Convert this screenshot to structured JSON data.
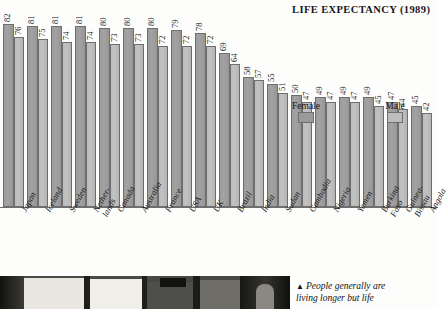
{
  "title": "LIFE EXPECTANCY (1989)",
  "legend": {
    "female_label": "Female",
    "male_label": "Male",
    "female_color": "#9a9a9a",
    "male_color": "#bdbdbd"
  },
  "caption": {
    "marker": "▲",
    "line1": "People generally are",
    "line2": "living longer but life"
  },
  "chart_data": {
    "type": "bar",
    "title": "LIFE EXPECTANCY (1989)",
    "xlabel": "",
    "ylabel": "",
    "ylim": [
      0,
      85
    ],
    "grid": false,
    "legend_position": "inside-upper-right",
    "categories": [
      "Japan",
      "Iceland",
      "Sweden",
      "Nether-lands",
      "Canada",
      "Australia",
      "France",
      "USA",
      "UK",
      "Brazil",
      "India",
      "Sudan",
      "Cambodia",
      "Nigeria",
      "Yemen",
      "Burkina Faso",
      "Guinea-Bissau",
      "Angola"
    ],
    "series": [
      {
        "name": "Female",
        "color": "#9a9a9a",
        "values": [
          82,
          81,
          81,
          81,
          80,
          80,
          80,
          79,
          78,
          69,
          58,
          55,
          50,
          49,
          49,
          49,
          47,
          45
        ]
      },
      {
        "name": "Male",
        "color": "#bdbdbd",
        "values": [
          76,
          75,
          74,
          74,
          73,
          73,
          72,
          72,
          72,
          64,
          57,
          51,
          47,
          47,
          47,
          45,
          44,
          42
        ]
      }
    ]
  },
  "countries": [
    {
      "name": "Japan",
      "l1": "Japan",
      "l2": "",
      "female": 82,
      "male": 76
    },
    {
      "name": "Iceland",
      "l1": "Iceland",
      "l2": "",
      "female": 81,
      "male": 75
    },
    {
      "name": "Sweden",
      "l1": "Sweden",
      "l2": "",
      "female": 81,
      "male": 74
    },
    {
      "name": "Nether-lands",
      "l1": "Nether-",
      "l2": "lands",
      "female": 81,
      "male": 74
    },
    {
      "name": "Canada",
      "l1": "Canada",
      "l2": "",
      "female": 80,
      "male": 73
    },
    {
      "name": "Australia",
      "l1": "Australia",
      "l2": "",
      "female": 80,
      "male": 73
    },
    {
      "name": "France",
      "l1": "France",
      "l2": "",
      "female": 80,
      "male": 72
    },
    {
      "name": "USA",
      "l1": "USA",
      "l2": "",
      "female": 79,
      "male": 72
    },
    {
      "name": "UK",
      "l1": "UK",
      "l2": "",
      "female": 78,
      "male": 72
    },
    {
      "name": "Brazil",
      "l1": "Brazil",
      "l2": "",
      "female": 69,
      "male": 64
    },
    {
      "name": "India",
      "l1": "India",
      "l2": "",
      "female": 58,
      "male": 57
    },
    {
      "name": "Sudan",
      "l1": "Sudan",
      "l2": "",
      "female": 55,
      "male": 51
    },
    {
      "name": "Cambodia",
      "l1": "Cambodia",
      "l2": "",
      "female": 50,
      "male": 47
    },
    {
      "name": "Nigeria",
      "l1": "Nigeria",
      "l2": "",
      "female": 49,
      "male": 47
    },
    {
      "name": "Yemen",
      "l1": "Yemen",
      "l2": "",
      "female": 49,
      "male": 47
    },
    {
      "name": "Burkina Faso",
      "l1": "Burkina",
      "l2": "Faso",
      "female": 49,
      "male": 45
    },
    {
      "name": "Guinea-Bissau",
      "l1": "Guinea-",
      "l2": "Bissau",
      "female": 47,
      "male": 44
    },
    {
      "name": "Angola",
      "l1": "Angola",
      "l2": "",
      "female": 45,
      "male": 42
    }
  ]
}
